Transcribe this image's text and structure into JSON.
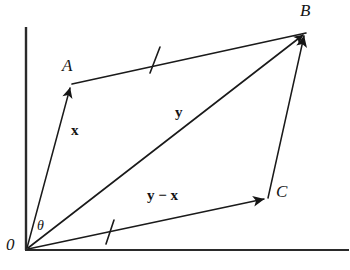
{
  "figure": {
    "type": "vector-parallelogram-diagram",
    "background_color": "#ffffff",
    "stroke_color": "#1a1a1a",
    "axes": {
      "y_axis": {
        "name": "vertical-axis",
        "x": 26,
        "y_top": 27,
        "y_bottom": 250
      },
      "x_axis": {
        "name": "horizontal-axis",
        "y": 250,
        "x_left": 26,
        "x_right": 349
      }
    },
    "points": [
      {
        "id": "O",
        "label": "0",
        "x": 26,
        "y": 249,
        "label_x": 6,
        "label_y": 236
      },
      {
        "id": "A",
        "label": "A",
        "x": 72,
        "y": 84,
        "label_x": 62,
        "label_y": 57
      },
      {
        "id": "B",
        "label": "B",
        "x": 307,
        "y": 32,
        "label_x": 300,
        "label_y": 2
      },
      {
        "id": "C",
        "label": "C",
        "x": 268,
        "y": 198,
        "label_x": 276,
        "label_y": 183
      }
    ],
    "vectors": [
      {
        "id": "x",
        "label": "x",
        "from": "O",
        "to": "A",
        "arrow": true,
        "label_x": 71,
        "label_y": 123
      },
      {
        "id": "y",
        "label": "y",
        "from": "O",
        "to": "B",
        "arrow": true,
        "label_x": 175,
        "label_y": 105
      },
      {
        "id": "y-minus-x",
        "label": "y − x",
        "from": "O",
        "to": "C",
        "arrow": true,
        "label_x": 147,
        "label_y": 188
      },
      {
        "id": "AB",
        "label": "",
        "from": "A",
        "to": "B",
        "arrow": false
      },
      {
        "id": "CB",
        "label": "",
        "from": "C",
        "to": "B",
        "arrow": true
      }
    ],
    "tick_marks": [
      {
        "id": "tick-upper",
        "on": "AB",
        "x": 155,
        "y": 60
      },
      {
        "id": "tick-lower",
        "on": "OC",
        "x": 110,
        "y": 232
      }
    ],
    "angle": {
      "id": "theta",
      "label": "θ",
      "vertex": "O",
      "between": [
        "x",
        "y"
      ],
      "label_x": 37,
      "label_y": 219
    }
  }
}
